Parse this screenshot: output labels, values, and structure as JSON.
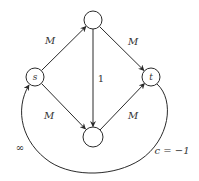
{
  "diagram": {
    "type": "flow-network",
    "nodes": [
      {
        "id": "s",
        "label": "s",
        "cx": 35,
        "cy": 77,
        "r": 9
      },
      {
        "id": "top",
        "label": "",
        "cx": 93,
        "cy": 20,
        "r": 9
      },
      {
        "id": "t",
        "label": "t",
        "cx": 151,
        "cy": 77,
        "r": 9
      },
      {
        "id": "bottom",
        "label": "",
        "cx": 93,
        "cy": 137,
        "r": 10
      }
    ],
    "edges": [
      {
        "from": "s",
        "to": "top",
        "label": "M"
      },
      {
        "from": "top",
        "to": "t",
        "label": "M"
      },
      {
        "from": "s",
        "to": "bottom",
        "label": "M"
      },
      {
        "from": "bottom",
        "to": "t",
        "label": "M"
      },
      {
        "from": "top",
        "to": "bottom",
        "label": "1"
      },
      {
        "from": "t",
        "to": "s",
        "label": "∞",
        "curved": true,
        "cost_label": "c = −1"
      }
    ],
    "labels": {
      "s_top": "M",
      "top_t": "M",
      "s_bottom": "M",
      "bottom_t": "M",
      "top_bottom": "1",
      "return_capacity": "∞",
      "return_cost": "c = −1"
    },
    "colors": {
      "stroke": "#2a2a2a",
      "text": "#333333",
      "background": "#ffffff"
    }
  }
}
